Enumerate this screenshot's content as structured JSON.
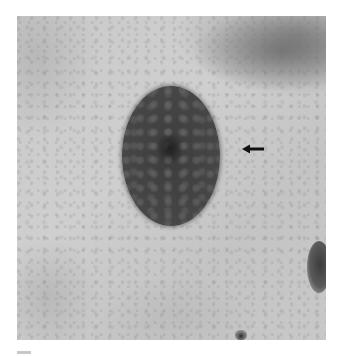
{
  "figure": {
    "description": "Grayscale light micrograph of a cell with an oval, darkly stained nucleus showing granular chromatin; an arrow points to the nuclear boundary on its right side",
    "annotation": {
      "type": "arrow",
      "direction": "left",
      "target": "nucleus edge"
    },
    "colors": {
      "background": "#ffffff",
      "cytoplasm": "#c9c9c9",
      "nucleus": "#424242",
      "arrow": "#111111"
    }
  }
}
